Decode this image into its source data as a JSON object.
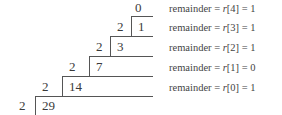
{
  "diagram": {
    "divisor": "2",
    "top_quotient": "0",
    "steps": [
      {
        "divisor": "2",
        "dividend": "29"
      },
      {
        "divisor": "2",
        "dividend": "14"
      },
      {
        "divisor": "2",
        "dividend": "7"
      },
      {
        "divisor": "2",
        "dividend": "3"
      },
      {
        "divisor": "2",
        "dividend": "1"
      }
    ],
    "remainders": [
      {
        "label": "remainder = ",
        "var": "r",
        "index": "[4]",
        "value": " = 1"
      },
      {
        "label": "remainder = ",
        "var": "r",
        "index": "[3]",
        "value": " = 1"
      },
      {
        "label": "remainder = ",
        "var": "r",
        "index": "[2]",
        "value": " = 1"
      },
      {
        "label": "remainder = ",
        "var": "r",
        "index": "[1]",
        "value": " = 0"
      },
      {
        "label": "remainder = ",
        "var": "r",
        "index": "[0]",
        "value": " = 1"
      }
    ]
  }
}
